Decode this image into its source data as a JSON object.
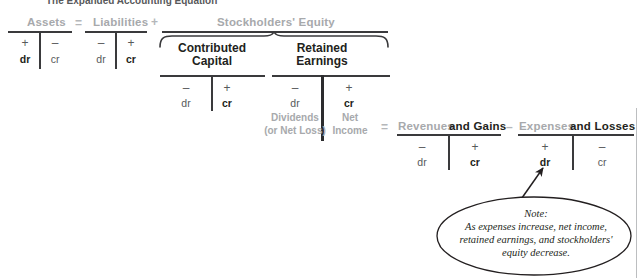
{
  "title": "The Expanded Accounting Equation",
  "equation": {
    "operators": {
      "equals": "=",
      "plus": "+",
      "minus": "–"
    },
    "signs": {
      "plus": "+",
      "minus": "–"
    },
    "debit": "dr",
    "credit": "cr"
  },
  "accounts": {
    "assets": {
      "label": "Assets",
      "debit_sign": "+",
      "credit_sign": "–",
      "debit": "dr",
      "credit": "cr",
      "normal_balance": "debit"
    },
    "liabilities": {
      "label": "Liabilities",
      "debit_sign": "–",
      "credit_sign": "+",
      "debit": "dr",
      "credit": "cr",
      "normal_balance": "credit"
    },
    "stockholders_equity": {
      "label": "Stockholders' Equity"
    },
    "contributed_capital": {
      "label_line1": "Contributed",
      "label_line2": "Capital",
      "debit_sign": "–",
      "credit_sign": "+",
      "debit": "dr",
      "credit": "cr",
      "normal_balance": "credit"
    },
    "retained_earnings": {
      "label_line1": "Retained",
      "label_line2": "Earnings",
      "debit_sign": "–",
      "credit_sign": "+",
      "debit": "dr",
      "credit": "cr",
      "normal_balance": "credit",
      "debit_detail_line1": "Dividends",
      "debit_detail_line2": "(or Net Loss)",
      "credit_detail_line1": "Net",
      "credit_detail_line2": "Income"
    },
    "revenues": {
      "label_grey": "Revenues",
      "label_black": "and Gains",
      "debit_sign": "–",
      "credit_sign": "+",
      "debit": "dr",
      "credit": "cr",
      "normal_balance": "credit"
    },
    "expenses": {
      "label_grey": "Expenses",
      "label_black": "and Losses",
      "debit_sign": "+",
      "credit_sign": "–",
      "debit": "dr",
      "credit": "cr",
      "normal_balance": "debit"
    }
  },
  "note": {
    "heading": "Note:",
    "line1": "As expenses increase, net income,",
    "line2": "retained earnings, and stockholders'",
    "line3": "equity decrease."
  },
  "colors": {
    "grey_label": "#a7a9ac",
    "dark_text": "#231f20",
    "rule": "#3a3a3c",
    "mid_text": "#58595b"
  }
}
